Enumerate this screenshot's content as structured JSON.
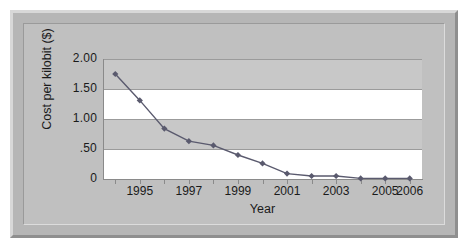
{
  "chart_data": {
    "type": "line",
    "title": "",
    "xlabel": "Year",
    "ylabel": "Cost per kilobit ($)",
    "x": [
      1994,
      1995,
      1996,
      1997,
      1998,
      1999,
      2000,
      2001,
      2002,
      2003,
      2004,
      2005,
      2006
    ],
    "values": [
      1.75,
      1.31,
      0.84,
      0.63,
      0.56,
      0.4,
      0.26,
      0.09,
      0.05,
      0.05,
      0.01,
      0.01,
      0.01
    ],
    "series": [
      {
        "name": "Cost per kilobit",
        "values": [
          1.75,
          1.31,
          0.84,
          0.63,
          0.56,
          0.4,
          0.26,
          0.09,
          0.05,
          0.05,
          0.01,
          0.01,
          0.01
        ]
      }
    ],
    "xlim": [
      1993.5,
      2006.5
    ],
    "ylim": [
      0,
      2.0
    ],
    "ytick_values": [
      2.0,
      1.5,
      1.0,
      0.5,
      0
    ],
    "ytick_labels": [
      "2.00",
      "1.50",
      "1.00",
      ".50",
      "0"
    ],
    "xtick_values": [
      1995,
      1997,
      1999,
      2001,
      2003,
      2005,
      2006
    ],
    "xtick_labels": [
      "1995",
      "1997",
      "1999",
      "2001",
      "2003",
      "2005",
      "2006"
    ],
    "grid": true,
    "legend": "none",
    "marker": "diamond",
    "series_color": "#5a5a6e",
    "band_color": "#c8c8c8",
    "plot_background": "#ffffff",
    "frame_color": "#b6b6b6"
  },
  "figure": {
    "axis_title_x": "Year",
    "axis_title_y": "Cost per kilobit ($)"
  }
}
